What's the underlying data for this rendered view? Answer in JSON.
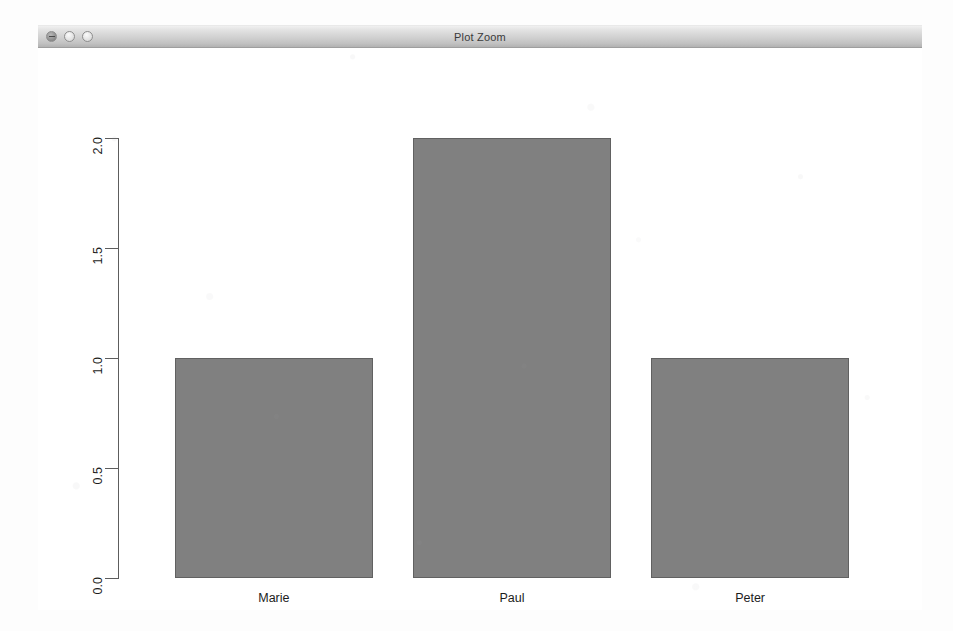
{
  "window": {
    "title": "Plot Zoom",
    "buttons": [
      {
        "name": "close-button",
        "label": "Close"
      },
      {
        "name": "minimize-button",
        "label": "Minimize"
      },
      {
        "name": "maximize-button",
        "label": "Zoom"
      }
    ]
  },
  "chart_data": {
    "type": "bar",
    "title": "",
    "subtitle": "",
    "xlabel": "",
    "ylabel": "",
    "categories": [
      "Marie",
      "Paul",
      "Peter"
    ],
    "values": [
      1.0,
      2.0,
      1.0
    ],
    "series": [
      {
        "name": "count",
        "values": [
          1.0,
          2.0,
          1.0
        ]
      }
    ],
    "ylim": [
      0.0,
      2.0
    ],
    "yticks": [
      "0.0",
      "0.5",
      "1.0",
      "1.5",
      "2.0"
    ],
    "ytick_values": [
      0.0,
      0.5,
      1.0,
      1.5,
      2.0
    ],
    "grid": false,
    "legend": null,
    "bar_fill_color": "#808080",
    "bar_border_color": "#616161",
    "axis_color": "#5d5d5d",
    "background_color": "#ffffff",
    "tick_label_rotation": 90,
    "annotations": []
  }
}
